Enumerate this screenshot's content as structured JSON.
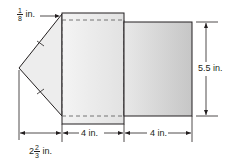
{
  "diagram": {
    "type": "net",
    "labels": {
      "flap_width": {
        "whole": "",
        "num": "1",
        "den": "8",
        "unit": "in."
      },
      "height": "5.5 in.",
      "middle_width": "4 in.",
      "right_width": "4 in.",
      "triangle_width": {
        "whole": "2",
        "num": "2",
        "den": "3",
        "unit": "in."
      }
    },
    "colors": {
      "stroke": "#231f20",
      "middle_fill": "#f2f2f2",
      "right_fill_light": "#e6e6e6",
      "right_fill_dark": "#c4c4c4",
      "triangle_fill": "#ececec"
    }
  }
}
